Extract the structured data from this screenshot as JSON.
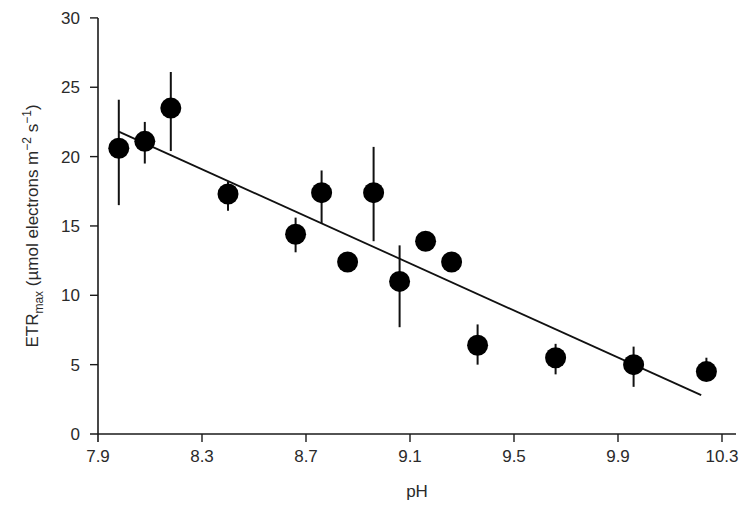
{
  "chart_data": {
    "type": "scatter",
    "title": "",
    "xlabel": "pH",
    "ylabel": "ETRmax (µmol electrons m−2 s−1)",
    "ylabel_parts": {
      "main": "ETR",
      "sub": "max",
      "rest1": " (µmol electrons m",
      "sup1": "−2",
      "rest2": " s",
      "sup2": "−1",
      "rest3": ")"
    },
    "xlim": [
      7.9,
      10.35
    ],
    "ylim": [
      0,
      30
    ],
    "xticks": [
      7.9,
      8.3,
      8.7,
      9.1,
      9.5,
      9.9,
      10.3
    ],
    "xtick_labels": [
      "7.9",
      "8.3",
      "8.7",
      "9.1",
      "9.5",
      "9.9",
      "10.3"
    ],
    "yticks": [
      0,
      5,
      10,
      15,
      20,
      25,
      30
    ],
    "ytick_labels": [
      "0",
      "5",
      "10",
      "15",
      "20",
      "25",
      "30"
    ],
    "grid": false,
    "legend": null,
    "series": [
      {
        "name": "ETRmax",
        "marker": "filled-circle",
        "color": "#000000",
        "points": [
          {
            "x": 7.98,
            "y": 20.6,
            "err_low": 16.5,
            "err_high": 24.1
          },
          {
            "x": 8.08,
            "y": 21.1,
            "err_low": 19.5,
            "err_high": 22.5
          },
          {
            "x": 8.18,
            "y": 23.5,
            "err_low": 20.4,
            "err_high": 26.1
          },
          {
            "x": 8.4,
            "y": 17.3,
            "err_low": 16.1,
            "err_high": 18.2
          },
          {
            "x": 8.66,
            "y": 14.4,
            "err_low": 13.1,
            "err_high": 15.6
          },
          {
            "x": 8.76,
            "y": 17.4,
            "err_low": 15.2,
            "err_high": 19.0
          },
          {
            "x": 8.86,
            "y": 12.4,
            "err_low": 12.4,
            "err_high": 12.4
          },
          {
            "x": 8.96,
            "y": 17.4,
            "err_low": 13.9,
            "err_high": 20.7
          },
          {
            "x": 9.06,
            "y": 11.0,
            "err_low": 7.7,
            "err_high": 13.6
          },
          {
            "x": 9.16,
            "y": 13.9,
            "err_low": 13.9,
            "err_high": 13.9
          },
          {
            "x": 9.26,
            "y": 12.4,
            "err_low": 12.4,
            "err_high": 12.4
          },
          {
            "x": 9.36,
            "y": 6.4,
            "err_low": 5.0,
            "err_high": 7.9
          },
          {
            "x": 9.66,
            "y": 5.5,
            "err_low": 4.3,
            "err_high": 6.5
          },
          {
            "x": 9.96,
            "y": 5.0,
            "err_low": 3.4,
            "err_high": 6.3
          },
          {
            "x": 10.24,
            "y": 4.5,
            "err_low": 3.9,
            "err_high": 5.5
          }
        ]
      }
    ],
    "fit_line": {
      "type": "linear",
      "x": [
        7.98,
        10.22
      ],
      "y": [
        21.8,
        2.8
      ]
    }
  },
  "layout": {
    "plot": {
      "x0": 98,
      "x1": 736,
      "y0": 434,
      "y1": 18
    },
    "x_per_unit": 260,
    "y_per_unit": 13.87,
    "marker_radius": 10.5
  }
}
